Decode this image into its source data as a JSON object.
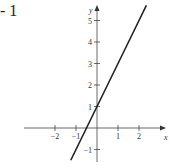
{
  "problem_label": "- 1",
  "chart_data": {
    "type": "line",
    "title": "",
    "xlabel": "x",
    "ylabel": "y",
    "xlim": [
      -3.5,
      3.4
    ],
    "ylim": [
      -1.5,
      5.9
    ],
    "x_ticks": [
      -2,
      -1,
      1,
      2
    ],
    "y_ticks": [
      -1,
      1,
      2,
      3,
      4,
      5
    ],
    "x_tick_labels": [
      "−2",
      "−1",
      "1",
      "2"
    ],
    "y_tick_labels": [
      "−1",
      "1",
      "2",
      "3",
      "4",
      "5"
    ],
    "grid": false,
    "legend": null,
    "series": [
      {
        "name": "y = 2x + 1",
        "equation": "y = 2x + 1",
        "x": [
          -1.25,
          -0.5,
          0,
          1,
          2,
          2.35
        ],
        "y": [
          -1.5,
          0,
          1,
          3,
          5,
          5.7
        ]
      }
    ]
  }
}
